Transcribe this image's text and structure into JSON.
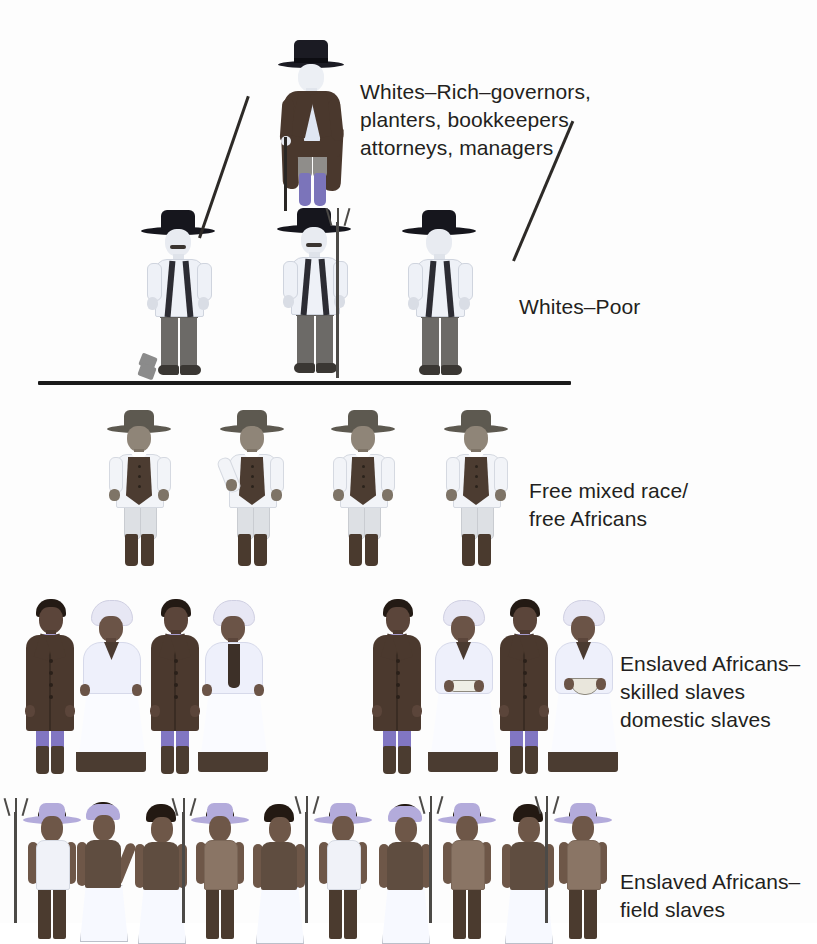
{
  "diagram": {
    "type": "pyramid-hierarchy",
    "background_color": "#ffffff",
    "text_color": "#231f20",
    "divider_color": "#1a1a1a"
  },
  "labels": {
    "rich_whites": "Whites–Rich–governors,\nplanters, bookkeepers\nattorneys, managers",
    "poor_whites": "Whites–Poor",
    "free_mixed": "Free mixed race/\nfree Africans",
    "skilled_slaves": "Enslaved Africans–\nskilled slaves\ndomestic slaves",
    "field_slaves": "Enslaved Africans–\nfield slaves"
  },
  "tiers": [
    {
      "id": "tier-rich-whites",
      "rank": 1,
      "label": "Whites–Rich–governors, planters, bookkeepers attorneys, managers",
      "figure_count": 1,
      "figures": [
        {
          "type": "rich-white-man",
          "x": 272,
          "y": 33,
          "prop": "walking-cane",
          "colors": {
            "hat": "#1b1b23",
            "coat": "#4a382d",
            "shirt": "#dfe6f3",
            "breeches": "#8f8d8a",
            "boots": "#7b74ba",
            "skin": "#eceff4"
          }
        }
      ]
    },
    {
      "id": "tier-poor-whites",
      "rank": 2,
      "label": "Whites–Poor",
      "figure_count": 3,
      "figures": [
        {
          "type": "poor-white-man",
          "x": 139,
          "y": 207,
          "prop": "hoe-diagonal-right",
          "colors": {
            "hat": "#16161d",
            "shirt": "#eef1f7",
            "suspenders": "#2c2c33",
            "trousers": "#6c6a67",
            "shoes": "#3a3733",
            "skin": "#e8ebf1"
          }
        },
        {
          "type": "poor-white-man",
          "x": 275,
          "y": 205,
          "prop": "pitchfork-vertical",
          "colors": {
            "hat": "#16161d",
            "shirt": "#eef1f7",
            "suspenders": "#2c2c33",
            "trousers": "#6c6a67",
            "shoes": "#3a3733",
            "skin": "#e8ebf1"
          }
        },
        {
          "type": "poor-white-man",
          "x": 400,
          "y": 207,
          "prop": "hoe-diagonal-right",
          "colors": {
            "hat": "#16161d",
            "shirt": "#eef1f7",
            "suspenders": "#2c2c33",
            "trousers": "#6c6a67",
            "shoes": "#3a3733",
            "skin": "#e8ebf1"
          }
        }
      ]
    },
    {
      "id": "tier-free-mixed-race",
      "rank": 3,
      "label": "Free mixed race/ free Africans",
      "figure_count": 4,
      "figures": [
        {
          "type": "free-mixed-man",
          "x": 103,
          "y": 407,
          "prop": "none",
          "colors": {
            "hat": "#5d5950",
            "shirt": "#f2f4f8",
            "vest": "#4c3c31",
            "breeches": "#dde0e4",
            "boots": "#4a3a2e",
            "skin": "#8f8578"
          }
        },
        {
          "type": "free-mixed-man",
          "x": 216,
          "y": 407,
          "prop": "none",
          "colors": {
            "hat": "#5d5950",
            "shirt": "#f2f4f8",
            "vest": "#4c3c31",
            "breeches": "#dde0e4",
            "boots": "#4a3a2e",
            "skin": "#8f8578"
          }
        },
        {
          "type": "free-mixed-man",
          "x": 327,
          "y": 407,
          "prop": "none",
          "colors": {
            "hat": "#5d5950",
            "shirt": "#f2f4f8",
            "vest": "#4c3c31",
            "breeches": "#dde0e4",
            "boots": "#4a3a2e",
            "skin": "#8f8578"
          }
        },
        {
          "type": "free-mixed-man",
          "x": 440,
          "y": 407,
          "prop": "none",
          "colors": {
            "hat": "#5d5950",
            "shirt": "#f2f4f8",
            "vest": "#4c3c31",
            "breeches": "#dde0e4",
            "boots": "#4a3a2e",
            "skin": "#8f8578"
          }
        }
      ]
    },
    {
      "id": "tier-skilled-domestic-slaves",
      "rank": 4,
      "label": "Enslaved Africans– skilled slaves domestic slaves",
      "figure_count": 8,
      "group_gap_between_index": 4,
      "figures": [
        {
          "type": "skilled-slave-man",
          "x": 18,
          "y": 597,
          "prop": "none",
          "colors": {
            "coat": "#4b392e",
            "shirt": "#a79ccf",
            "breeches": "#8176c2",
            "boots": "#4b3c30",
            "skin": "#5b453a"
          }
        },
        {
          "type": "skilled-slave-woman",
          "x": 72,
          "y": 600,
          "prop": "none",
          "colors": {
            "headwrap": "#e7e7f4",
            "shawl": "#eef0fb",
            "skirt": "#fafbff",
            "hem": "#4b3c31",
            "skin": "#6b5447"
          }
        },
        {
          "type": "skilled-slave-man",
          "x": 143,
          "y": 597,
          "prop": "none",
          "colors": {
            "coat": "#4b392e",
            "shirt": "#a79ccf",
            "breeches": "#8176c2",
            "boots": "#4b3c30",
            "skin": "#5b453a"
          }
        },
        {
          "type": "skilled-slave-woman",
          "x": 194,
          "y": 600,
          "prop": "neck-scarf",
          "colors": {
            "headwrap": "#e7e7f4",
            "shawl": "#eef0fb",
            "skirt": "#fafbff",
            "hem": "#4b3c31",
            "skin": "#6b5447"
          }
        },
        {
          "type": "skilled-slave-man",
          "x": 365,
          "y": 597,
          "prop": "none",
          "colors": {
            "coat": "#4b392e",
            "shirt": "#a79ccf",
            "breeches": "#8176c2",
            "boots": "#4b3c30",
            "skin": "#5b453a"
          }
        },
        {
          "type": "skilled-slave-woman",
          "x": 424,
          "y": 600,
          "prop": "serving-tray",
          "colors": {
            "headwrap": "#e7e7f4",
            "shawl": "#eef0fb",
            "skirt": "#fafbff",
            "hem": "#4b3c31",
            "skin": "#6b5447"
          }
        },
        {
          "type": "skilled-slave-man",
          "x": 492,
          "y": 597,
          "prop": "none",
          "colors": {
            "coat": "#4b392e",
            "shirt": "#a79ccf",
            "breeches": "#8176c2",
            "boots": "#4b3c30",
            "skin": "#5b453a"
          }
        },
        {
          "type": "skilled-slave-woman",
          "x": 544,
          "y": 600,
          "prop": "serving-bowl",
          "colors": {
            "headwrap": "#e7e7f4",
            "shawl": "#eef0fb",
            "skirt": "#fafbff",
            "hem": "#4b3c31",
            "skin": "#6b5447"
          }
        }
      ]
    },
    {
      "id": "tier-field-slaves",
      "rank": 5,
      "label": "Enslaved Africans– field slaves",
      "figure_count": 11,
      "figures": [
        {
          "type": "field-slave-man",
          "x": 10,
          "y": 800,
          "dress": "sleeveless-white",
          "hat": "straw",
          "prop": "pitchfork-vertical",
          "colors": {
            "hat": "#b3abdb",
            "shirt": "#f0f2f8",
            "trousers": "#4b3b2f",
            "skin": "#6e5748"
          }
        },
        {
          "type": "field-slave-woman",
          "x": 66,
          "y": 800,
          "dress": "dark-top-white-skirt",
          "hat": "straw",
          "prop": "none",
          "colors": {
            "kerchief": "#b3abdb",
            "top": "#5f4d40",
            "skirt": "#f7f9ff",
            "skin": "#6e5748"
          }
        },
        {
          "type": "field-slave-woman",
          "x": 128,
          "y": 802,
          "dress": "dark-top-white-skirt",
          "hat": "none",
          "prop": "none",
          "colors": {
            "top": "#5f4d40",
            "skirt": "#f7f9ff",
            "skin": "#6e5748"
          }
        },
        {
          "type": "field-slave-man",
          "x": 185,
          "y": 800,
          "dress": "bare-chest",
          "hat": "straw",
          "prop": "pitchfork-vertical",
          "colors": {
            "hat": "#b3abdb",
            "chest": "#8a7565",
            "trousers": "#4b3b2f",
            "skin": "#6e5748"
          }
        },
        {
          "type": "field-slave-woman",
          "x": 246,
          "y": 802,
          "dress": "dark-top-white-skirt",
          "hat": "none",
          "prop": "none",
          "colors": {
            "top": "#5f4d40",
            "skirt": "#f7f9ff",
            "skin": "#6e5748"
          }
        },
        {
          "type": "field-slave-man",
          "x": 307,
          "y": 800,
          "dress": "white-shirt",
          "hat": "straw",
          "prop": "pitchfork-vertical",
          "colors": {
            "hat": "#b3abdb",
            "shirt": "#f0f2f8",
            "trousers": "#4b3b2f",
            "skin": "#6e5748"
          }
        },
        {
          "type": "field-slave-woman",
          "x": 372,
          "y": 802,
          "dress": "dark-top-white-skirt",
          "hat": "kerchief",
          "prop": "none",
          "colors": {
            "kerchief": "#b3abdb",
            "top": "#5f4d40",
            "skirt": "#f7f9ff",
            "skin": "#6e5748"
          }
        },
        {
          "type": "field-slave-man",
          "x": 432,
          "y": 800,
          "dress": "bare-chest",
          "hat": "straw",
          "prop": "pitchfork-vertical",
          "colors": {
            "hat": "#b3abdb",
            "chest": "#8a7565",
            "trousers": "#4b3b2f",
            "skin": "#6e5748"
          }
        },
        {
          "type": "field-slave-woman",
          "x": 495,
          "y": 802,
          "dress": "dark-top-white-skirt",
          "hat": "none",
          "prop": "none",
          "colors": {
            "top": "#5f4d40",
            "skirt": "#f7f9ff",
            "skin": "#6e5748"
          }
        },
        {
          "type": "field-slave-man",
          "x": 548,
          "y": 800,
          "dress": "bare-chest",
          "hat": "straw",
          "prop": "pitchfork-vertical",
          "colors": {
            "hat": "#b3abdb",
            "chest": "#8a7565",
            "trousers": "#4b3b2f",
            "skin": "#6e5748"
          }
        }
      ]
    }
  ],
  "divider": {
    "x": 38,
    "y": 381,
    "width": 533,
    "height": 4,
    "note": "horizontal rule separating whites from free people of colour"
  }
}
